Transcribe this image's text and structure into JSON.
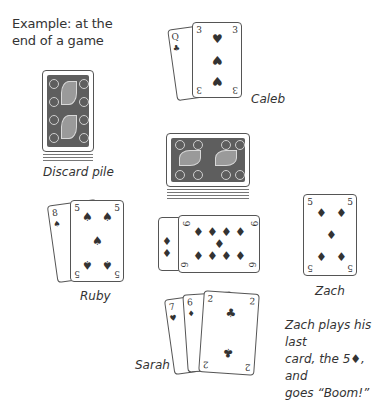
{
  "title_line1": "Example: at the",
  "title_line2": "end of a game",
  "labels": {
    "discard": "Discard pile",
    "caleb": "Caleb",
    "ruby": "Ruby",
    "zach": "Zach",
    "sarah": "Sarah"
  },
  "note": {
    "line1": "Zach plays his last",
    "line2": "card, the 5♦, and",
    "line3": "goes “Boom!”"
  },
  "players": {
    "caleb": {
      "cards": [
        {
          "rank": "Q",
          "suit": "♣"
        },
        {
          "rank": "3",
          "suit": "♥"
        }
      ]
    },
    "ruby": {
      "cards": [
        {
          "rank": "8",
          "suit": "♠"
        },
        {
          "rank": "5",
          "suit": "♠"
        }
      ]
    },
    "zach": {
      "cards": [
        {
          "rank": "5",
          "suit": "♦"
        }
      ]
    },
    "sarah": {
      "cards": [
        {
          "rank": "7",
          "suit": "♥"
        },
        {
          "rank": "6",
          "suit": "♦"
        },
        {
          "rank": "2",
          "suit": "♣"
        }
      ]
    },
    "center": {
      "cards": [
        {
          "rank": "9",
          "suit": "♦"
        },
        {
          "rank": "9",
          "suit": "♦"
        }
      ]
    }
  }
}
